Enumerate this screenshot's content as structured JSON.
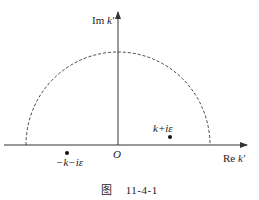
{
  "figure": {
    "y_axis_label_prefix": "Im",
    "y_axis_label_var": "k′",
    "x_axis_label_prefix": "Re",
    "x_axis_label_var": "k′",
    "origin_label": "O",
    "point_upper_label": "k+iε",
    "point_lower_label": "−k−iε",
    "caption_prefix": "图",
    "caption_number": "11-4-1"
  },
  "colors": {
    "line": "#333333",
    "background": "#ffffff"
  }
}
